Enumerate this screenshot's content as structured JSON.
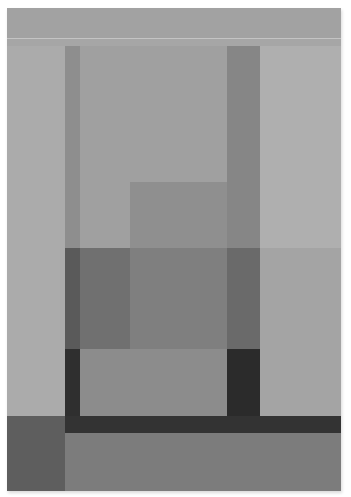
{
  "artwork": {
    "caption": "Abstract geometric composition in gray tones",
    "background": "#a9a9a9",
    "blocks": [
      {
        "name": "top-band",
        "x": 0,
        "y": 0,
        "w": 334,
        "h": 30,
        "color": "#a2a2a2"
      },
      {
        "name": "top-light-line",
        "x": 0,
        "y": 30,
        "w": 334,
        "h": 1,
        "color": "#c4c4c4"
      },
      {
        "name": "top-sub-band",
        "x": 0,
        "y": 31,
        "w": 334,
        "h": 7,
        "color": "#a6a6a6"
      },
      {
        "name": "left-panel",
        "x": 0,
        "y": 38,
        "w": 58,
        "h": 370,
        "color": "#ababab"
      },
      {
        "name": "right-panel-upper",
        "x": 253,
        "y": 38,
        "w": 81,
        "h": 202,
        "color": "#afafaf"
      },
      {
        "name": "right-panel-lower",
        "x": 253,
        "y": 240,
        "w": 81,
        "h": 168,
        "color": "#a4a4a4"
      },
      {
        "name": "left-column-upper",
        "x": 58,
        "y": 38,
        "w": 15,
        "h": 202,
        "color": "#8e8e8e"
      },
      {
        "name": "center-upper",
        "x": 73,
        "y": 38,
        "w": 147,
        "h": 136,
        "color": "#a0a0a0"
      },
      {
        "name": "center-left-mid",
        "x": 73,
        "y": 174,
        "w": 50,
        "h": 66,
        "color": "#a0a0a0"
      },
      {
        "name": "center-step",
        "x": 123,
        "y": 174,
        "w": 97,
        "h": 66,
        "color": "#8f8f8f"
      },
      {
        "name": "right-column-upper",
        "x": 220,
        "y": 38,
        "w": 33,
        "h": 202,
        "color": "#868686"
      },
      {
        "name": "left-column-lower",
        "x": 58,
        "y": 240,
        "w": 15,
        "h": 101,
        "color": "#5a5a5a"
      },
      {
        "name": "center-left-lower",
        "x": 73,
        "y": 240,
        "w": 50,
        "h": 101,
        "color": "#707070"
      },
      {
        "name": "center-mid-lower",
        "x": 123,
        "y": 240,
        "w": 97,
        "h": 101,
        "color": "#7f7f7f"
      },
      {
        "name": "right-column-lower",
        "x": 220,
        "y": 240,
        "w": 33,
        "h": 101,
        "color": "#6a6a6a"
      },
      {
        "name": "left-column-bottom",
        "x": 58,
        "y": 341,
        "w": 15,
        "h": 67,
        "color": "#2f2f2f"
      },
      {
        "name": "center-box-bottom",
        "x": 73,
        "y": 341,
        "w": 147,
        "h": 67,
        "color": "#8c8c8c"
      },
      {
        "name": "right-column-bottom",
        "x": 220,
        "y": 341,
        "w": 33,
        "h": 67,
        "color": "#2b2b2b"
      },
      {
        "name": "bottom-left-block",
        "x": 0,
        "y": 408,
        "w": 58,
        "h": 75,
        "color": "#5e5e5e"
      },
      {
        "name": "dark-horizontal-bar",
        "x": 58,
        "y": 408,
        "w": 276,
        "h": 17,
        "color": "#333333"
      },
      {
        "name": "bottom-band",
        "x": 58,
        "y": 425,
        "w": 276,
        "h": 58,
        "color": "#7c7c7c"
      }
    ]
  }
}
